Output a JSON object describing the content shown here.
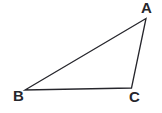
{
  "figure": {
    "name": "triangle-abc",
    "kind": "geometry-diagram",
    "background_color": "#ffffff",
    "stroke_color": "#26262c",
    "stroke_width": 1.3,
    "width": 162,
    "height": 113
  },
  "labels": {
    "a": "A",
    "b": "B",
    "c": "C"
  },
  "chart_data": {
    "type": "diagram",
    "title": "",
    "shape": "triangle",
    "vertices": [
      {
        "name": "A",
        "x": 146,
        "y": 18.5
      },
      {
        "name": "B",
        "x": 25,
        "y": 90
      },
      {
        "name": "C",
        "x": 131.5,
        "y": 88
      }
    ],
    "edges": [
      {
        "from": "B",
        "to": "A"
      },
      {
        "from": "A",
        "to": "C"
      },
      {
        "from": "C",
        "to": "B"
      }
    ],
    "label_positions": [
      {
        "name": "A",
        "x": 141,
        "y": 0
      },
      {
        "name": "B",
        "x": 13,
        "y": 88
      },
      {
        "name": "C",
        "x": 129,
        "y": 89
      }
    ]
  }
}
